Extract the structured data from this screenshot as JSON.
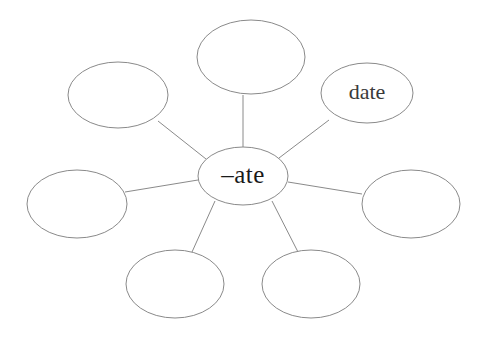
{
  "diagram": {
    "type": "word-family-web",
    "center": {
      "label": "– ate",
      "text": "–ate"
    },
    "stroke_color": "#8a8a8a",
    "text_color": "#1a1a1a",
    "background_color": "#ffffff",
    "nodes": [
      {
        "id": "top",
        "label": "",
        "position": "top"
      },
      {
        "id": "top-right",
        "label": "date",
        "position": "top-right"
      },
      {
        "id": "right",
        "label": "",
        "position": "right"
      },
      {
        "id": "bottom-right",
        "label": "",
        "position": "bottom-right"
      },
      {
        "id": "bottom-left",
        "label": "",
        "position": "bottom-left"
      },
      {
        "id": "left",
        "label": "",
        "position": "left"
      },
      {
        "id": "top-left",
        "label": "",
        "position": "top-left"
      }
    ]
  }
}
